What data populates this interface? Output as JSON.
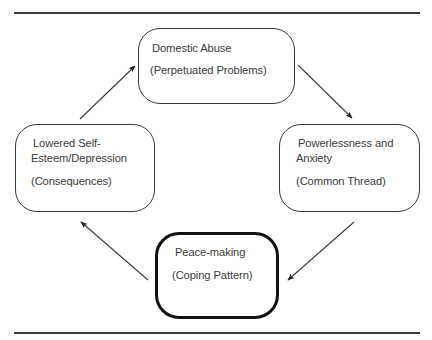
{
  "diagram": {
    "type": "cycle",
    "colors": {
      "line": "#3a3a3a",
      "text": "#3a3a3a",
      "emphasis_border": "#111111",
      "background": "#ffffff"
    },
    "nodes": [
      {
        "id": "domestic-abuse",
        "position": "top",
        "title_lines": [
          "Domestic Abuse"
        ],
        "subtitle": "(Perpetuated Problems)",
        "emphasized": false
      },
      {
        "id": "powerlessness-anxiety",
        "position": "right",
        "title_lines": [
          "Powerlessness and",
          "Anxiety"
        ],
        "subtitle": "(Common Thread)",
        "emphasized": false
      },
      {
        "id": "peace-making",
        "position": "bottom",
        "title_lines": [
          "Peace-making"
        ],
        "subtitle": "(Coping Pattern)",
        "emphasized": true
      },
      {
        "id": "lowered-self-esteem",
        "position": "left",
        "title_lines": [
          "Lowered Self-",
          "Esteem/Depression"
        ],
        "subtitle": "(Consequences)",
        "emphasized": false
      }
    ],
    "edges": [
      {
        "from": "domestic-abuse",
        "to": "powerlessness-anxiety"
      },
      {
        "from": "powerlessness-anxiety",
        "to": "peace-making"
      },
      {
        "from": "peace-making",
        "to": "lowered-self-esteem"
      },
      {
        "from": "lowered-self-esteem",
        "to": "domestic-abuse"
      }
    ]
  }
}
